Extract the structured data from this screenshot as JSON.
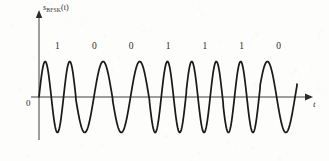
{
  "figure": {
    "kind": "bfsk-waveform",
    "background_color": "#fdfdfc",
    "curve_color": "#1a1a1a",
    "axis_color": "#9a9a9a",
    "text_color": "#2b2b2b"
  },
  "labels": {
    "y_axis_main": "s",
    "y_axis_subscript": "BFSK",
    "y_axis_arg": "(t)",
    "x_axis": "t",
    "origin": "0"
  },
  "chart_data": {
    "type": "line",
    "title": "",
    "subtitle": "",
    "xlabel": "t",
    "ylabel": "s_BFSK(t)",
    "grid": false,
    "legend": null,
    "axis_origin_label": "0",
    "xlim": [
      0,
      7
    ],
    "ylim": [
      -1.15,
      1.15
    ],
    "amplitude": 1,
    "bit_labels": [
      "1",
      "0",
      "0",
      "1",
      "1",
      "1",
      "0"
    ],
    "bits": [
      1,
      0,
      0,
      1,
      1,
      1,
      0
    ],
    "cycles_per_bit": {
      "one": 1.5,
      "zero": 1.0
    },
    "symbol_interval": 1,
    "series": [
      {
        "name": "s_BFSK(t)",
        "color": "#1a1a1a"
      }
    ]
  },
  "geometry": {
    "axis_y_px": 97,
    "axis_x_px": 39,
    "peak_y_px": 62,
    "trough_y_px": 133,
    "wave_start_px": 39,
    "wave_end_px": 297,
    "x_axis_end_px": 311,
    "y_axis_top_px": 12,
    "y_axis_bottom_px": 140
  }
}
